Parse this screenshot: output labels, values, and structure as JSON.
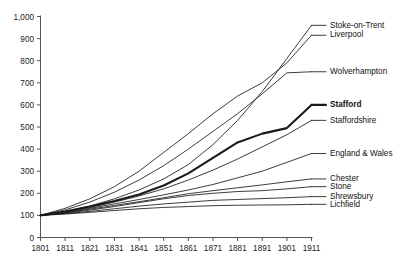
{
  "chart_data": {
    "type": "line",
    "title": "",
    "xlabel": "",
    "ylabel": "",
    "x": [
      1801,
      1811,
      1821,
      1831,
      1841,
      1851,
      1861,
      1871,
      1881,
      1891,
      1901,
      1911
    ],
    "xlim": [
      1801,
      1911
    ],
    "ylim": [
      0,
      1000
    ],
    "yticks": [
      0,
      100,
      200,
      300,
      400,
      500,
      600,
      700,
      800,
      900,
      1000
    ],
    "ytick_labels": [
      "0",
      "100",
      "200",
      "300",
      "400",
      "500",
      "600",
      "700",
      "800",
      "900",
      "1,000"
    ],
    "xtick_labels": [
      "1801",
      "1811",
      "1821",
      "1831",
      "1841",
      "1851",
      "1861",
      "1871",
      "1881",
      "1891",
      "1901",
      "1911"
    ],
    "grid": false,
    "legend_position": "right-inline",
    "series": [
      {
        "name": "Stoke-on-Trent",
        "label_y_value": 960,
        "emphasis": false,
        "values": [
          100,
          118,
          142,
          175,
          215,
          265,
          330,
          420,
          530,
          660,
          810,
          960
        ]
      },
      {
        "name": "Liverpool",
        "label_y_value": 915,
        "emphasis": false,
        "values": [
          100,
          132,
          175,
          230,
          300,
          385,
          470,
          560,
          640,
          700,
          790,
          915
        ]
      },
      {
        "name": "Wolverhampton",
        "label_y_value": 750,
        "emphasis": false,
        "values": [
          100,
          125,
          160,
          205,
          260,
          325,
          400,
          480,
          560,
          650,
          745,
          750
        ]
      },
      {
        "name": "Stafford",
        "label_y_value": 600,
        "emphasis": true,
        "values": [
          100,
          118,
          140,
          165,
          195,
          235,
          290,
          360,
          430,
          470,
          495,
          600
        ]
      },
      {
        "name": "Staffordshire",
        "label_y_value": 530,
        "emphasis": false,
        "values": [
          100,
          115,
          135,
          160,
          188,
          220,
          260,
          305,
          355,
          410,
          465,
          530
        ]
      },
      {
        "name": "England & Wales",
        "label_y_value": 380,
        "emphasis": false,
        "values": [
          100,
          114,
          132,
          152,
          172,
          193,
          215,
          240,
          270,
          300,
          340,
          380
        ]
      },
      {
        "name": "Chester",
        "label_y_value": 265,
        "emphasis": false,
        "values": [
          100,
          112,
          128,
          145,
          162,
          180,
          198,
          212,
          225,
          238,
          252,
          265
        ]
      },
      {
        "name": "Stone",
        "label_y_value": 230,
        "emphasis": false,
        "values": [
          100,
          110,
          124,
          140,
          158,
          175,
          190,
          200,
          208,
          212,
          220,
          230
        ]
      },
      {
        "name": "Shrewsbury",
        "label_y_value": 185,
        "emphasis": false,
        "values": [
          100,
          108,
          118,
          130,
          142,
          152,
          160,
          168,
          172,
          176,
          180,
          185
        ]
      },
      {
        "name": "Lichfield",
        "label_y_value": 150,
        "emphasis": false,
        "values": [
          100,
          106,
          114,
          122,
          130,
          136,
          140,
          144,
          146,
          147,
          148,
          150
        ]
      }
    ]
  }
}
